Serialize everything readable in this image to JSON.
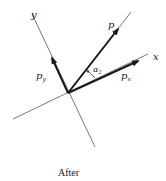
{
  "diagram": {
    "caption": "After",
    "axes": {
      "x_label": "x",
      "y_label": "y"
    },
    "vectors": {
      "p_label": "p",
      "px_label": "p",
      "px_sub": "x",
      "py_label": "p",
      "py_sub": "y"
    },
    "angle": {
      "label": "α",
      "sub": "2"
    },
    "colors": {
      "axis": "#555555",
      "vector": "#1a1a1a",
      "background": "#ffffff"
    }
  }
}
